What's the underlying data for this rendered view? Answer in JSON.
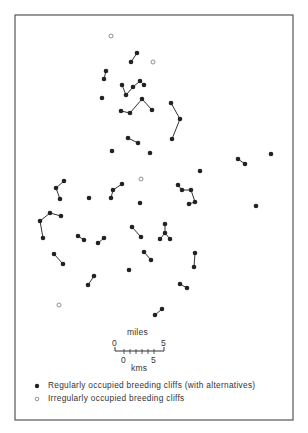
{
  "map": {
    "frame": {
      "x": 15,
      "y": 15,
      "width": 278,
      "height": 405,
      "stroke": "#555555"
    },
    "colors": {
      "dot_fill": "#222222",
      "line": "#333333",
      "open_circle_stroke": "#777777"
    },
    "regular_cliffs": [
      [
        137,
        53
      ],
      [
        131,
        62
      ],
      [
        106,
        71
      ],
      [
        104,
        79
      ],
      [
        122,
        85
      ],
      [
        126,
        95
      ],
      [
        133,
        87
      ],
      [
        140,
        81
      ],
      [
        144,
        85
      ],
      [
        102,
        98
      ],
      [
        121,
        111
      ],
      [
        130,
        113
      ],
      [
        142,
        99
      ],
      [
        152,
        110
      ],
      [
        171,
        103
      ],
      [
        180,
        119
      ],
      [
        172,
        139
      ],
      [
        128,
        138
      ],
      [
        138,
        143
      ],
      [
        112,
        151
      ],
      [
        150,
        153
      ],
      [
        238,
        159
      ],
      [
        245,
        164
      ],
      [
        271,
        154
      ],
      [
        200,
        171
      ],
      [
        64,
        181
      ],
      [
        56,
        188
      ],
      [
        60,
        199
      ],
      [
        89,
        198
      ],
      [
        122,
        184
      ],
      [
        113,
        190
      ],
      [
        111,
        198
      ],
      [
        178,
        185
      ],
      [
        182,
        190
      ],
      [
        191,
        190
      ],
      [
        195,
        202
      ],
      [
        189,
        204
      ],
      [
        140,
        203
      ],
      [
        256,
        206
      ],
      [
        50,
        213
      ],
      [
        40,
        221
      ],
      [
        43,
        238
      ],
      [
        61,
        216
      ],
      [
        78,
        236
      ],
      [
        84,
        240
      ],
      [
        98,
        243
      ],
      [
        104,
        238
      ],
      [
        132,
        227
      ],
      [
        141,
        237
      ],
      [
        165,
        224
      ],
      [
        165,
        233
      ],
      [
        160,
        239
      ],
      [
        170,
        239
      ],
      [
        54,
        254
      ],
      [
        63,
        264
      ],
      [
        144,
        252
      ],
      [
        151,
        260
      ],
      [
        195,
        253
      ],
      [
        194,
        267
      ],
      [
        129,
        270
      ],
      [
        94,
        276
      ],
      [
        88,
        285
      ],
      [
        180,
        284
      ],
      [
        187,
        288
      ],
      [
        162,
        309
      ],
      [
        155,
        315
      ]
    ],
    "links": [
      [
        [
          137,
          53
        ],
        [
          131,
          62
        ]
      ],
      [
        [
          106,
          71
        ],
        [
          104,
          79
        ]
      ],
      [
        [
          122,
          85
        ],
        [
          126,
          95
        ]
      ],
      [
        [
          126,
          95
        ],
        [
          133,
          87
        ]
      ],
      [
        [
          133,
          87
        ],
        [
          140,
          81
        ]
      ],
      [
        [
          140,
          81
        ],
        [
          144,
          85
        ]
      ],
      [
        [
          121,
          111
        ],
        [
          130,
          113
        ]
      ],
      [
        [
          130,
          113
        ],
        [
          142,
          99
        ]
      ],
      [
        [
          142,
          99
        ],
        [
          152,
          110
        ]
      ],
      [
        [
          171,
          103
        ],
        [
          180,
          119
        ]
      ],
      [
        [
          180,
          119
        ],
        [
          172,
          139
        ]
      ],
      [
        [
          128,
          138
        ],
        [
          138,
          143
        ]
      ],
      [
        [
          238,
          159
        ],
        [
          245,
          164
        ]
      ],
      [
        [
          64,
          181
        ],
        [
          56,
          188
        ]
      ],
      [
        [
          56,
          188
        ],
        [
          60,
          199
        ]
      ],
      [
        [
          122,
          184
        ],
        [
          113,
          190
        ]
      ],
      [
        [
          113,
          190
        ],
        [
          111,
          198
        ]
      ],
      [
        [
          178,
          185
        ],
        [
          182,
          190
        ]
      ],
      [
        [
          182,
          190
        ],
        [
          191,
          190
        ]
      ],
      [
        [
          191,
          190
        ],
        [
          195,
          202
        ]
      ],
      [
        [
          195,
          202
        ],
        [
          189,
          204
        ]
      ],
      [
        [
          50,
          213
        ],
        [
          40,
          221
        ]
      ],
      [
        [
          40,
          221
        ],
        [
          43,
          238
        ]
      ],
      [
        [
          50,
          213
        ],
        [
          61,
          216
        ]
      ],
      [
        [
          78,
          236
        ],
        [
          84,
          240
        ]
      ],
      [
        [
          98,
          243
        ],
        [
          104,
          238
        ]
      ],
      [
        [
          132,
          227
        ],
        [
          141,
          237
        ]
      ],
      [
        [
          165,
          224
        ],
        [
          165,
          233
        ]
      ],
      [
        [
          165,
          233
        ],
        [
          160,
          239
        ]
      ],
      [
        [
          165,
          233
        ],
        [
          170,
          239
        ]
      ],
      [
        [
          54,
          254
        ],
        [
          63,
          264
        ]
      ],
      [
        [
          144,
          252
        ],
        [
          151,
          260
        ]
      ],
      [
        [
          195,
          253
        ],
        [
          194,
          267
        ]
      ],
      [
        [
          94,
          276
        ],
        [
          88,
          285
        ]
      ],
      [
        [
          180,
          284
        ],
        [
          187,
          288
        ]
      ],
      [
        [
          162,
          309
        ],
        [
          155,
          315
        ]
      ]
    ],
    "irregular_cliffs": [
      [
        111,
        36
      ],
      [
        153,
        62
      ],
      [
        141,
        179
      ],
      [
        59,
        305
      ]
    ]
  },
  "scale_bar": {
    "miles_label": "miles",
    "miles_start": "0",
    "miles_end": "5",
    "kms_start": "0",
    "kms_end": "5",
    "kms_label": "kms"
  },
  "legend": {
    "regular": "Regularly occupied breeding cliffs (with alternatives)",
    "irregular": "Irregularly occupied breeding cliffs"
  }
}
